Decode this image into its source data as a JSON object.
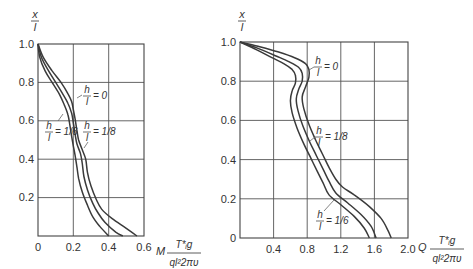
{
  "chart_data": [
    {
      "type": "line",
      "title": "",
      "xlabel": "M T*g / (q l^2 2πυ)",
      "ylabel": "x / l",
      "xlim": [
        0,
        0.6
      ],
      "ylim": [
        0,
        1.0
      ],
      "x_ticks": [
        "0",
        "0.2",
        "0.4",
        "0.6"
      ],
      "y_ticks": [
        "0.2",
        "0.4",
        "0.6",
        "0.8",
        "1.0"
      ],
      "grid": true,
      "legend_position": "inline annotations",
      "series": [
        {
          "name": "h/l = 0",
          "points": [
            [
              0.0,
              1.0
            ],
            [
              0.03,
              0.93
            ],
            [
              0.08,
              0.86
            ],
            [
              0.13,
              0.8
            ],
            [
              0.17,
              0.74
            ],
            [
              0.19,
              0.7
            ],
            [
              0.2,
              0.66
            ],
            [
              0.21,
              0.61
            ],
            [
              0.22,
              0.55
            ],
            [
              0.23,
              0.5
            ],
            [
              0.25,
              0.45
            ],
            [
              0.27,
              0.4
            ],
            [
              0.28,
              0.33
            ],
            [
              0.3,
              0.26
            ],
            [
              0.33,
              0.19
            ],
            [
              0.36,
              0.14
            ],
            [
              0.42,
              0.09
            ],
            [
              0.5,
              0.04
            ],
            [
              0.56,
              0.0
            ]
          ]
        },
        {
          "name": "h/l = 1/8",
          "points": [
            [
              0.0,
              1.0
            ],
            [
              0.02,
              0.93
            ],
            [
              0.06,
              0.86
            ],
            [
              0.1,
              0.8
            ],
            [
              0.14,
              0.74
            ],
            [
              0.17,
              0.69
            ],
            [
              0.19,
              0.64
            ],
            [
              0.2,
              0.59
            ],
            [
              0.21,
              0.53
            ],
            [
              0.22,
              0.48
            ],
            [
              0.24,
              0.43
            ],
            [
              0.25,
              0.38
            ],
            [
              0.26,
              0.31
            ],
            [
              0.28,
              0.24
            ],
            [
              0.31,
              0.17
            ],
            [
              0.34,
              0.12
            ],
            [
              0.38,
              0.07
            ],
            [
              0.44,
              0.02
            ],
            [
              0.48,
              0.0
            ]
          ]
        },
        {
          "name": "h/l = 1/6",
          "points": [
            [
              0.0,
              1.0
            ],
            [
              0.01,
              0.93
            ],
            [
              0.04,
              0.86
            ],
            [
              0.08,
              0.8
            ],
            [
              0.12,
              0.74
            ],
            [
              0.15,
              0.68
            ],
            [
              0.17,
              0.63
            ],
            [
              0.18,
              0.58
            ],
            [
              0.19,
              0.52
            ],
            [
              0.2,
              0.47
            ],
            [
              0.21,
              0.42
            ],
            [
              0.22,
              0.36
            ],
            [
              0.23,
              0.3
            ],
            [
              0.25,
              0.23
            ],
            [
              0.28,
              0.16
            ],
            [
              0.31,
              0.1
            ],
            [
              0.35,
              0.05
            ],
            [
              0.4,
              0.0
            ]
          ]
        }
      ]
    },
    {
      "type": "line",
      "title": "",
      "xlabel": "Q T*g / (q l^2 2πυ)",
      "ylabel": "x / l",
      "xlim": [
        0,
        2.0
      ],
      "ylim": [
        0,
        1.0
      ],
      "x_ticks": [
        "0.4",
        "0.8",
        "1.2",
        "1.6",
        "2.0"
      ],
      "y_ticks": [
        "0",
        "0.2",
        "0.4",
        "0.6",
        "0.8",
        "1.0"
      ],
      "grid": true,
      "legend_position": "inline annotations",
      "series": [
        {
          "name": "h/l = 0",
          "points": [
            [
              0.0,
              1.0
            ],
            [
              0.2,
              0.98
            ],
            [
              0.45,
              0.95
            ],
            [
              0.65,
              0.92
            ],
            [
              0.78,
              0.89
            ],
            [
              0.82,
              0.86
            ],
            [
              0.82,
              0.82
            ],
            [
              0.78,
              0.77
            ],
            [
              0.74,
              0.72
            ],
            [
              0.76,
              0.66
            ],
            [
              0.82,
              0.58
            ],
            [
              0.9,
              0.5
            ],
            [
              0.98,
              0.43
            ],
            [
              1.06,
              0.36
            ],
            [
              1.14,
              0.3
            ],
            [
              1.22,
              0.26
            ],
            [
              1.36,
              0.22
            ],
            [
              1.54,
              0.16
            ],
            [
              1.68,
              0.1
            ],
            [
              1.76,
              0.04
            ],
            [
              1.8,
              0.0
            ]
          ]
        },
        {
          "name": "h/l = 1/8",
          "points": [
            [
              0.0,
              1.0
            ],
            [
              0.2,
              0.97
            ],
            [
              0.42,
              0.93
            ],
            [
              0.58,
              0.9
            ],
            [
              0.7,
              0.87
            ],
            [
              0.74,
              0.84
            ],
            [
              0.74,
              0.8
            ],
            [
              0.7,
              0.76
            ],
            [
              0.67,
              0.71
            ],
            [
              0.69,
              0.65
            ],
            [
              0.75,
              0.57
            ],
            [
              0.83,
              0.49
            ],
            [
              0.91,
              0.42
            ],
            [
              0.99,
              0.35
            ],
            [
              1.06,
              0.29
            ],
            [
              1.14,
              0.23
            ],
            [
              1.28,
              0.18
            ],
            [
              1.44,
              0.12
            ],
            [
              1.56,
              0.06
            ],
            [
              1.62,
              0.0
            ]
          ]
        },
        {
          "name": "h/l = 1/6",
          "points": [
            [
              0.0,
              1.0
            ],
            [
              0.2,
              0.96
            ],
            [
              0.38,
              0.92
            ],
            [
              0.52,
              0.89
            ],
            [
              0.62,
              0.86
            ],
            [
              0.66,
              0.83
            ],
            [
              0.66,
              0.79
            ],
            [
              0.62,
              0.75
            ],
            [
              0.6,
              0.7
            ],
            [
              0.62,
              0.64
            ],
            [
              0.68,
              0.56
            ],
            [
              0.76,
              0.48
            ],
            [
              0.84,
              0.41
            ],
            [
              0.92,
              0.34
            ],
            [
              0.99,
              0.28
            ],
            [
              1.06,
              0.22
            ],
            [
              1.2,
              0.17
            ],
            [
              1.36,
              0.11
            ],
            [
              1.48,
              0.05
            ],
            [
              1.54,
              0.0
            ]
          ]
        }
      ]
    }
  ],
  "left_chart": {
    "y_axis_label_num": "x",
    "y_axis_label_den": "l",
    "x_axis_prefix": "M",
    "x_axis_label_num": "T*ᵢg",
    "x_axis_label_den": "ql²2πυ",
    "annotations": [
      {
        "num": "h",
        "den": "l",
        "value": "= 0"
      },
      {
        "num": "h",
        "den": "l",
        "value": "= 1/6"
      },
      {
        "num": "h",
        "den": "l",
        "value": "= 1/8"
      }
    ]
  },
  "right_chart": {
    "y_axis_label_num": "x",
    "y_axis_label_den": "l",
    "x_axis_prefix": "Q",
    "x_axis_label_num": "T*ᵢg",
    "x_axis_label_den": "ql²2πυ",
    "annotations": [
      {
        "num": "h",
        "den": "l",
        "value": "= 0"
      },
      {
        "num": "h",
        "den": "l",
        "value": "= 1/8"
      },
      {
        "num": "h",
        "den": "l",
        "value": "= 1/6"
      }
    ]
  },
  "colors": {
    "curve": "#3a3a3a",
    "grid": "#555555",
    "text": "#333333",
    "background": "#ffffff"
  }
}
